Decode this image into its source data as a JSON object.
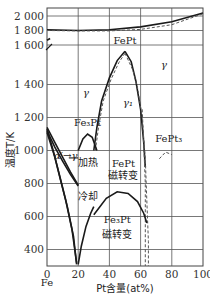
{
  "chart_data": {
    "type": "line",
    "title": "",
    "xlabel": "Pt含量(at%)",
    "ylabel": "温度T/K",
    "x_start_label": "Fe",
    "xlim": [
      0,
      100
    ],
    "ylim": [
      300,
      2050
    ],
    "y_axis_break": {
      "from": 1450,
      "to": 1600
    },
    "grid": true,
    "xticks": [
      0,
      20,
      40,
      60,
      80,
      100
    ],
    "xtick_labels": [
      "0",
      "20",
      "40",
      "60",
      "80",
      "100"
    ],
    "yticks_upper": [
      1600,
      1800,
      2000
    ],
    "ytick_labels_upper": [
      "1 600",
      "1 800",
      "2 000"
    ],
    "yticks_lower": [
      400,
      600,
      800,
      1000,
      1200,
      1400
    ],
    "ytick_labels_lower": [
      "400",
      "600",
      "800",
      "1 000",
      "1 200",
      "1 400"
    ],
    "series": [
      {
        "name": "liquidus",
        "style": "solid",
        "points": [
          [
            0,
            1809
          ],
          [
            20,
            1800
          ],
          [
            40,
            1810
          ],
          [
            60,
            1850
          ],
          [
            80,
            1920
          ],
          [
            100,
            2042
          ]
        ]
      },
      {
        "name": "solidus",
        "style": "dashed",
        "points": [
          [
            0,
            1800
          ],
          [
            20,
            1795
          ],
          [
            40,
            1795
          ],
          [
            60,
            1815
          ],
          [
            80,
            1880
          ],
          [
            100,
            2030
          ]
        ]
      },
      {
        "name": "delta-gamma",
        "style": "solid",
        "points": [
          [
            0,
            1665
          ],
          [
            2,
            1690
          ]
        ]
      },
      {
        "name": "FePt-order-left",
        "style": "solid",
        "points": [
          [
            30,
            1000
          ],
          [
            32,
            1140
          ],
          [
            35,
            1300
          ],
          [
            40,
            1440
          ],
          [
            45,
            1525
          ],
          [
            50,
            1570
          ]
        ]
      },
      {
        "name": "FePt-order-right",
        "style": "solid",
        "points": [
          [
            50,
            1570
          ],
          [
            54,
            1520
          ],
          [
            57,
            1420
          ],
          [
            60,
            1250
          ],
          [
            62,
            1050
          ],
          [
            63,
            900
          ]
        ]
      },
      {
        "name": "FePt-order-left-dashed",
        "style": "dashed",
        "points": [
          [
            31,
            1000
          ],
          [
            33,
            1140
          ],
          [
            36,
            1300
          ],
          [
            41,
            1430
          ],
          [
            46,
            1515
          ],
          [
            50,
            1560
          ]
        ]
      },
      {
        "name": "FePt-order-right-dashed",
        "style": "dashed",
        "points": [
          [
            50,
            1560
          ],
          [
            55,
            1480
          ],
          [
            58,
            1380
          ],
          [
            61,
            1200
          ],
          [
            63,
            950
          ],
          [
            64,
            700
          ],
          [
            65,
            450
          ],
          [
            65,
            300
          ]
        ]
      },
      {
        "name": "FePt-order-right-dashed-2",
        "style": "dashed",
        "points": [
          [
            61,
            1250
          ],
          [
            62,
            1050
          ],
          [
            63,
            800
          ],
          [
            63,
            600
          ],
          [
            63,
            300
          ]
        ]
      },
      {
        "name": "Fe3Pt-order",
        "style": "solid",
        "points": [
          [
            20,
            1000
          ],
          [
            23,
            1070
          ],
          [
            26,
            1100
          ],
          [
            29,
            1080
          ],
          [
            32,
            1000
          ]
        ]
      },
      {
        "name": "alpha-gamma-heating-outer",
        "style": "solid",
        "points": [
          [
            0,
            1140
          ],
          [
            5,
            1050
          ],
          [
            10,
            960
          ],
          [
            15,
            870
          ],
          [
            20,
            790
          ]
        ]
      },
      {
        "name": "alpha-gamma-heating-inner",
        "style": "solid",
        "points": [
          [
            0,
            1120
          ],
          [
            5,
            1020
          ],
          [
            10,
            935
          ],
          [
            15,
            855
          ],
          [
            20,
            785
          ]
        ]
      },
      {
        "name": "cooling-outer",
        "style": "solid",
        "points": [
          [
            0,
            1130
          ],
          [
            4,
            1000
          ],
          [
            8,
            850
          ],
          [
            12,
            700
          ],
          [
            16,
            520
          ],
          [
            19,
            320
          ]
        ]
      },
      {
        "name": "cooling-inner",
        "style": "solid",
        "points": [
          [
            0,
            1110
          ],
          [
            5,
            960
          ],
          [
            9,
            810
          ],
          [
            13,
            660
          ],
          [
            17,
            480
          ],
          [
            19,
            310
          ]
        ]
      },
      {
        "name": "Fe3Pt-magnetic",
        "style": "solid",
        "points": [
          [
            20,
            310
          ],
          [
            22,
            420
          ],
          [
            25,
            540
          ],
          [
            28,
            620
          ],
          [
            30,
            660
          ]
        ]
      },
      {
        "name": "FePt-magnetic",
        "style": "solid",
        "points": [
          [
            30,
            610
          ],
          [
            38,
            710
          ],
          [
            45,
            750
          ],
          [
            52,
            740
          ],
          [
            58,
            690
          ],
          [
            62,
            620
          ],
          [
            64,
            560
          ]
        ]
      },
      {
        "name": "FePt3-order",
        "style": "dashed",
        "points": [
          [
            72,
            950
          ],
          [
            76,
            990
          ],
          [
            80,
            975
          ]
        ]
      }
    ],
    "annotations": [
      {
        "text": "γ",
        "x": 25,
        "y": 1330
      },
      {
        "text": "FePt",
        "x": 50,
        "y": 1620
      },
      {
        "text": "γ",
        "x": 75,
        "y": 1490
      },
      {
        "text": "γ₁",
        "x": 52,
        "y": 1270
      },
      {
        "text": "Fe₃Pt",
        "x": 26,
        "y": 1150
      },
      {
        "text": "FePt₃",
        "x": 78,
        "y": 1050
      },
      {
        "text": "α′→γ",
        "x": 12,
        "y": 950
      },
      {
        "text": "加热",
        "x": 26,
        "y": 905
      },
      {
        "text": "FePt",
        "x": 49,
        "y": 900
      },
      {
        "text": "磁转变",
        "x": 49,
        "y": 830
      },
      {
        "text": "冷却",
        "x": 26,
        "y": 700
      },
      {
        "text": "Fe₃Pt",
        "x": 45,
        "y": 560
      },
      {
        "text": "磁转变",
        "x": 45,
        "y": 470
      }
    ]
  }
}
